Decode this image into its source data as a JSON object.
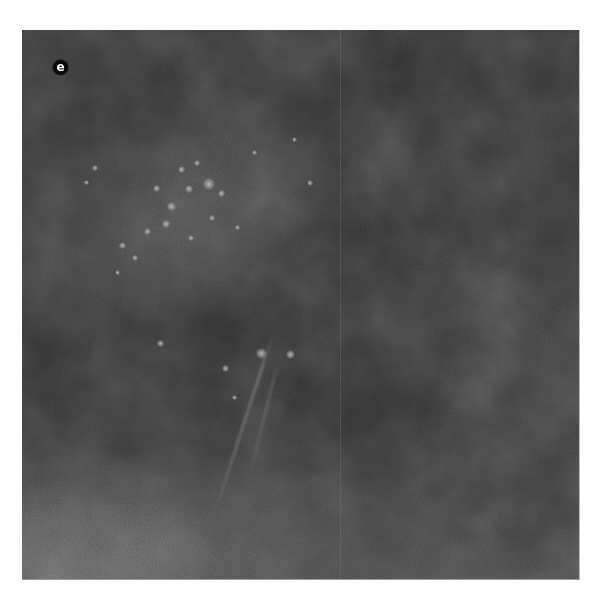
{
  "figure": {
    "panel_label": "e",
    "colors": {
      "background": "#ffffff",
      "image_base": "#2d2d2d",
      "label_badge_bg": "#0a0a0a",
      "label_badge_fg": "#ffffff"
    }
  }
}
